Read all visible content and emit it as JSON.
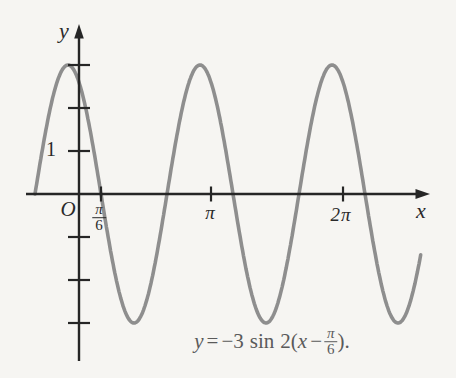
{
  "figure": {
    "background": "#f6f5f2",
    "curve_color": "#8e8e8e",
    "axis_color": "#262626",
    "text_color": "#2a2a2a",
    "equation_color": "#5a5a5a"
  },
  "chart_data": {
    "type": "line",
    "title": "",
    "equation_text": "y = −3 sin 2(x − π/6).",
    "function": {
      "amplitude": -3,
      "angular_coefficient": 2,
      "phase_shift_radians": 0.5236,
      "phase_shift_label": "π/6"
    },
    "x_domain_radians": [
      -1.0472,
      8.15
    ],
    "y_range": [
      -3,
      3
    ],
    "axis_labels": {
      "x": "x",
      "y": "y"
    },
    "origin_label": "O",
    "x_ticks": [
      {
        "value": 0.5236,
        "label": "π/6",
        "label_numerator": "π",
        "label_denominator": "6"
      },
      {
        "value": 3.1416,
        "label": "π"
      },
      {
        "value": 6.2832,
        "label": "2π"
      }
    ],
    "y_ticks": [
      {
        "value": 1,
        "label": "1"
      },
      {
        "value": 2,
        "label": ""
      },
      {
        "value": 3,
        "label": ""
      },
      {
        "value": -1,
        "label": ""
      },
      {
        "value": -2,
        "label": ""
      },
      {
        "value": -3,
        "label": ""
      }
    ],
    "equation_parts": {
      "y": "y",
      "equals": "=",
      "coefficient": "−3",
      "sin": "sin",
      "two_open": "2(",
      "x": "x",
      "minus": "−",
      "frac_numerator": "π",
      "frac_denominator": "6",
      "close": ")."
    },
    "pixel_mapping": {
      "origin_px": [
        79,
        194
      ],
      "px_per_radian": 42.02,
      "px_per_unit_y": 43
    }
  }
}
